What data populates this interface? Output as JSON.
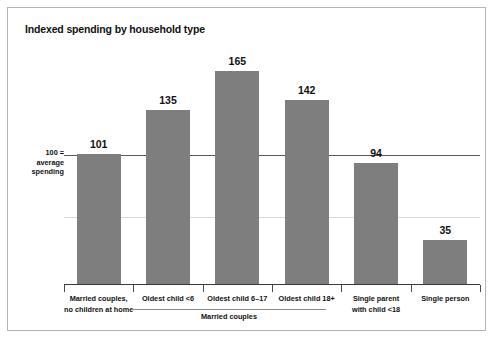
{
  "chart_data": {
    "type": "bar",
    "title": "Indexed spending by household type",
    "xlabel": "",
    "ylabel": "",
    "ylim": [
      0,
      180
    ],
    "grid": false,
    "legend": "none",
    "categories": [
      "Married couples,\nno children at home",
      "Oldest child <6",
      "Oldest child 6–17",
      "Oldest child 18+",
      "Single parent\nwith child <18",
      "Single person"
    ],
    "values": [
      101,
      135,
      165,
      142,
      94,
      35
    ],
    "reference_line": {
      "value": 100,
      "label_lines": [
        "100 =",
        "average",
        "spending"
      ]
    },
    "group_brackets": [
      {
        "label": "Married couples",
        "categories": [
          "Oldest child <6",
          "Oldest child 6–17",
          "Oldest child 18+"
        ]
      }
    ],
    "colors": {
      "bar": "#7e7e7e",
      "axis": "#3a3a3a",
      "reference_line": "#5a5a5a",
      "frame": "#b5b5b5",
      "text": "#111111",
      "background": "#ffffff"
    }
  },
  "chart": {
    "title": "Indexed spending by household type",
    "bars": [
      {
        "label_line1": "Married couples,",
        "label_line2": "no children at home",
        "value": "101"
      },
      {
        "label_line1": "Oldest child <6",
        "label_line2": "",
        "value": "135"
      },
      {
        "label_line1": "Oldest child 6–17",
        "label_line2": "",
        "value": "165"
      },
      {
        "label_line1": "Oldest child 18+",
        "label_line2": "",
        "value": "142"
      },
      {
        "label_line1": "Single parent",
        "label_line2": "with child <18",
        "value": "94"
      },
      {
        "label_line1": "Single person",
        "label_line2": "",
        "value": "35"
      }
    ],
    "reference": {
      "line1": "100 =",
      "line2": "average",
      "line3": "spending"
    },
    "group": {
      "label": "Married couples"
    }
  }
}
